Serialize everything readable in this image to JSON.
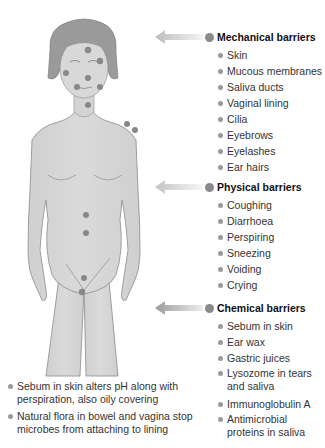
{
  "groups": [
    {
      "title": "Mechanical barriers",
      "items": [
        "Skin",
        "Mucous membranes",
        "Saliva ducts",
        "Vaginal lining",
        "Cilia",
        "Eyebrows",
        "Eyelashes",
        "Ear hairs"
      ]
    },
    {
      "title": "Physical barriers",
      "items": [
        "Coughing",
        "Diarrhoea",
        "Perspiring",
        "Sneezing",
        "Voiding",
        "Crying"
      ]
    },
    {
      "title": "Chemical barriers",
      "items": [
        "Sebum in skin",
        "Ear wax",
        "Gastric juices",
        "Lysozome in tears and saliva",
        "Immunoglobulin A",
        "Antimicrobial proteins in saliva"
      ]
    }
  ],
  "notes": [
    "Sebum in skin alters pH along with perspiration, also oily covering",
    "Natural flora in bowel and vagina stop microbes from attaching to lining"
  ],
  "colors": {
    "figure_fill": "#d4d4d4",
    "figure_outline": "#8c8c8c",
    "hair": "#9a9a9a",
    "marker": "#888888",
    "arrow_light": "#d8d8d8",
    "arrow_dark": "#9c9c9c"
  }
}
